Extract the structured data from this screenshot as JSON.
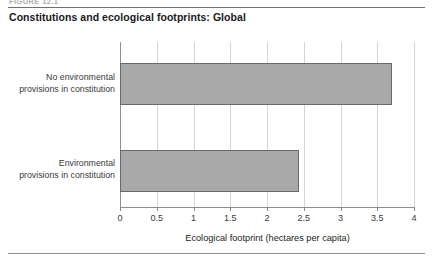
{
  "figure": {
    "number_label": "FIGURE 12.1",
    "title": "Constitutions and ecological footprints: Global"
  },
  "chart_data": {
    "type": "bar",
    "orientation": "horizontal",
    "title": "Constitutions and ecological footprints: Global",
    "categories": [
      "No environmental provisions in constitution",
      "Environmental provisions in constitution"
    ],
    "values": [
      3.7,
      2.43
    ],
    "xlabel": "Ecological footprint (hectares per capita)",
    "ylabel": "",
    "xlim": [
      0,
      4
    ],
    "xticks": [
      "0",
      "0.5",
      "1",
      "1.5",
      "2",
      "2.5",
      "3",
      "3.5",
      "4"
    ],
    "xtick_values": [
      0,
      0.5,
      1,
      1.5,
      2,
      2.5,
      3,
      3.5,
      4
    ],
    "grid": "vertical",
    "legend": "none",
    "bar_color": "#a9a9a9",
    "bar_border_color": "#6a6a6a"
  },
  "category_lines": {
    "cat0_line1": "No environmental",
    "cat0_line2": "provisions in constitution",
    "cat1_line1": "Environmental",
    "cat1_line2": "provisions in constitution"
  }
}
